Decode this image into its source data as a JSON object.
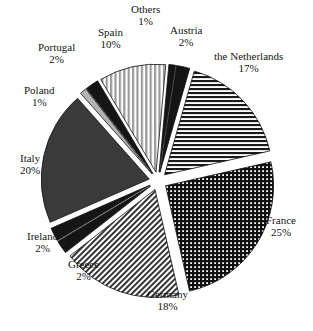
{
  "chart_data": {
    "type": "pie",
    "title": "",
    "exploded": true,
    "start_angle_deg": -74,
    "direction": "clockwise",
    "units": "percent",
    "categories": [
      "the Netherlands",
      "France",
      "Germany",
      "Greece",
      "Ireland",
      "Italy",
      "Poland",
      "Portugal",
      "Spain",
      "Others",
      "Austria"
    ],
    "values": [
      17,
      25,
      18,
      2,
      2,
      20,
      1,
      2,
      10,
      1,
      2
    ],
    "labels": [
      {
        "name": "the Netherlands",
        "percent": "17%",
        "fill": "hstripe",
        "lx": 248,
        "ly": 62
      },
      {
        "name": "France",
        "percent": "25%",
        "fill": "crosshatch",
        "lx": 281,
        "ly": 226
      },
      {
        "name": "Germany",
        "percent": "18%",
        "fill": "diaghatch",
        "lx": 167,
        "ly": 300
      },
      {
        "name": "Greece",
        "percent": "2%",
        "fill": "black",
        "lx": 83,
        "ly": 270
      },
      {
        "name": "Ireland",
        "percent": "2%",
        "fill": "black",
        "lx": 42,
        "ly": 242
      },
      {
        "name": "Italy",
        "percent": "20%",
        "fill": "darkgray",
        "lx": 30,
        "ly": 164
      },
      {
        "name": "Poland",
        "percent": "1%",
        "fill": "lightgray",
        "lx": 39,
        "ly": 96
      },
      {
        "name": "Portugal",
        "percent": "2%",
        "fill": "black",
        "lx": 56,
        "ly": 53
      },
      {
        "name": "Spain",
        "percent": "10%",
        "fill": "vstripe",
        "lx": 110,
        "ly": 38
      },
      {
        "name": "Others",
        "percent": "1%",
        "fill": "black",
        "lx": 145,
        "ly": 15
      },
      {
        "name": "Austria",
        "percent": "2%",
        "fill": "black",
        "lx": 186,
        "ly": 36
      }
    ],
    "colors": {
      "black": "#151515",
      "darkgray": "#3a3a3a",
      "lightgray": "#b3b3b3",
      "outline": "#111111",
      "background": "#ffffff"
    }
  }
}
